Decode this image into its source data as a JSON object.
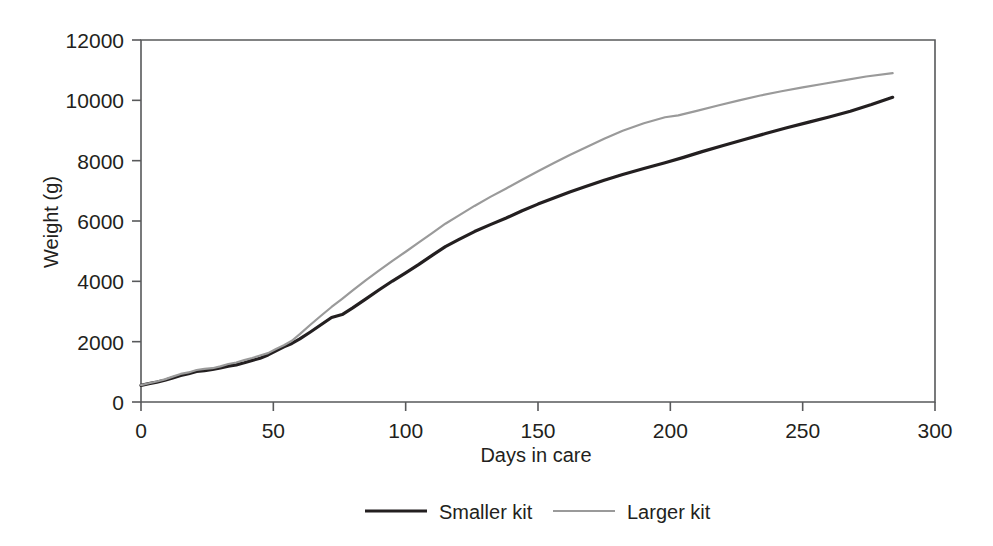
{
  "chart_data": {
    "type": "line",
    "title": "",
    "xlabel": "Days in care",
    "ylabel": "Weight (g)",
    "xlim": [
      0,
      300
    ],
    "ylim": [
      0,
      12000
    ],
    "xticks": [
      0,
      50,
      100,
      150,
      200,
      250,
      300
    ],
    "xtick_labels": [
      "0",
      "50",
      "100",
      "150",
      "200",
      "250",
      "300"
    ],
    "yticks": [
      0,
      2000,
      4000,
      6000,
      8000,
      10000,
      12000
    ],
    "ytick_labels": [
      "0",
      "2000",
      "4000",
      "6000",
      "8000",
      "10000",
      "12000"
    ],
    "grid": false,
    "legend_position": "bottom-center",
    "series": [
      {
        "name": "Smaller kit",
        "color": "#231f20",
        "line_width": 3.2,
        "x": [
          0,
          3,
          6,
          9,
          12,
          15,
          18,
          21,
          24,
          27,
          30,
          33,
          36,
          39,
          42,
          45,
          48,
          51,
          54,
          57,
          60,
          64,
          68,
          72,
          76,
          80,
          85,
          90,
          95,
          100,
          105,
          110,
          115,
          120,
          126,
          132,
          138,
          144,
          150,
          156,
          162,
          168,
          175,
          182,
          190,
          198,
          205,
          212,
          220,
          228,
          236,
          244,
          252,
          260,
          268,
          276,
          284
        ],
        "y": [
          550,
          610,
          660,
          720,
          800,
          880,
          940,
          1010,
          1040,
          1080,
          1130,
          1190,
          1230,
          1300,
          1380,
          1450,
          1560,
          1700,
          1830,
          1940,
          2090,
          2320,
          2560,
          2800,
          2900,
          3120,
          3420,
          3720,
          4010,
          4280,
          4560,
          4860,
          5150,
          5380,
          5650,
          5880,
          6100,
          6340,
          6560,
          6760,
          6960,
          7140,
          7350,
          7540,
          7740,
          7930,
          8110,
          8300,
          8500,
          8700,
          8900,
          9090,
          9270,
          9450,
          9640,
          9860,
          10100
        ]
      },
      {
        "name": "Larger kit",
        "color": "#9a9a9a",
        "line_width": 2.2,
        "x": [
          0,
          3,
          6,
          9,
          12,
          15,
          18,
          21,
          24,
          27,
          30,
          33,
          36,
          39,
          42,
          45,
          48,
          51,
          54,
          57,
          60,
          64,
          68,
          72,
          76,
          80,
          85,
          90,
          95,
          100,
          105,
          110,
          115,
          120,
          126,
          132,
          138,
          144,
          150,
          156,
          162,
          168,
          175,
          182,
          190,
          198,
          203,
          210,
          218,
          226,
          234,
          242,
          250,
          258,
          266,
          274,
          284
        ],
        "y": [
          560,
          620,
          680,
          750,
          840,
          930,
          980,
          1060,
          1100,
          1120,
          1180,
          1260,
          1310,
          1390,
          1460,
          1540,
          1620,
          1760,
          1880,
          2030,
          2250,
          2560,
          2860,
          3150,
          3420,
          3700,
          4040,
          4360,
          4680,
          4980,
          5290,
          5600,
          5910,
          6180,
          6500,
          6800,
          7080,
          7370,
          7650,
          7920,
          8190,
          8440,
          8730,
          8990,
          9240,
          9440,
          9500,
          9650,
          9830,
          10000,
          10160,
          10300,
          10430,
          10550,
          10670,
          10790,
          10900
        ]
      }
    ]
  },
  "legend": {
    "entries": [
      {
        "label": "Smaller kit",
        "color": "#231f20"
      },
      {
        "label": "Larger kit",
        "color": "#9a9a9a"
      }
    ]
  }
}
